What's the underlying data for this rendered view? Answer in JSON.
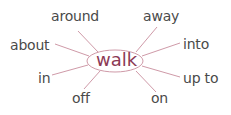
{
  "diagram": {
    "center": {
      "label": "walk",
      "color": "#8c3a55"
    },
    "line_color": "#cf9aa8",
    "words": [
      {
        "label": "around"
      },
      {
        "label": "away"
      },
      {
        "label": "about"
      },
      {
        "label": "into"
      },
      {
        "label": "in"
      },
      {
        "label": "up to"
      },
      {
        "label": "off"
      },
      {
        "label": "on"
      }
    ]
  }
}
